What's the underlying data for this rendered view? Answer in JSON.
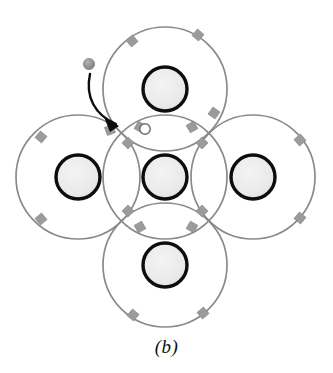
{
  "figure": {
    "caption": "(b)",
    "background_color": "#ffffff"
  },
  "style": {
    "shell_stroke": "#8a8a8a",
    "shell_fill": "none",
    "shell_stroke_width": 1.7,
    "core_ring_color": "#0d0d0d",
    "core_ring_width": 3.4,
    "core_fill": "#ebebeb",
    "core_fill_edge": "#d9d9d9",
    "electron_marker_color": "#9b9b9b",
    "electron_marker_edge": "#8a8a8a",
    "hole_fill": "#ffffff",
    "hole_stroke": "#6e6e6e",
    "free_electron_color": "#8f8f8f",
    "arrow_color": "#0d0d0d",
    "caption_color": "#111111"
  },
  "atoms": [
    {
      "name": "center-atom",
      "label": "center",
      "cx": 165,
      "cy": 177,
      "shell_r": 62,
      "core_r": 22
    },
    {
      "name": "top-atom",
      "label": "top",
      "cx": 165,
      "cy": 89,
      "shell_r": 62,
      "core_r": 22
    },
    {
      "name": "bottom-atom",
      "label": "bottom",
      "cx": 165,
      "cy": 265,
      "shell_r": 62,
      "core_r": 22
    },
    {
      "name": "left-atom",
      "label": "left",
      "cx": 78,
      "cy": 177,
      "shell_r": 62,
      "core_r": 22
    },
    {
      "name": "right-atom",
      "label": "right",
      "cx": 253,
      "cy": 177,
      "shell_r": 62,
      "core_r": 22
    }
  ],
  "electron_markers": [
    {
      "name": "electron-marker-top-left-inner",
      "cx": 128,
      "cy": 143,
      "angle": -45
    },
    {
      "name": "electron-marker-top-right-inner",
      "cx": 202,
      "cy": 143,
      "angle": 45
    },
    {
      "name": "electron-marker-bot-left-inner",
      "cx": 128,
      "cy": 211,
      "angle": 45
    },
    {
      "name": "electron-marker-bot-right-inner",
      "cx": 202,
      "cy": 211,
      "angle": -45
    },
    {
      "name": "electron-marker-top-bond-left",
      "cx": 140,
      "cy": 127,
      "angle": 30
    },
    {
      "name": "electron-marker-top-bond-right",
      "cx": 192,
      "cy": 127,
      "angle": -30
    },
    {
      "name": "electron-marker-bottom-bond-left",
      "cx": 140,
      "cy": 227,
      "angle": -30
    },
    {
      "name": "electron-marker-bottom-bond-right",
      "cx": 192,
      "cy": 227,
      "angle": 30
    },
    {
      "name": "electron-marker-top-outer-left",
      "cx": 132,
      "cy": 41,
      "angle": -40
    },
    {
      "name": "electron-marker-top-outer-right",
      "cx": 198,
      "cy": 35,
      "angle": 40
    },
    {
      "name": "electron-marker-top-shell-right",
      "cx": 214,
      "cy": 113,
      "angle": 35
    },
    {
      "name": "electron-marker-left-outer-top",
      "cx": 41,
      "cy": 137,
      "angle": 40
    },
    {
      "name": "electron-marker-left-outer-bottom",
      "cx": 41,
      "cy": 219,
      "angle": -40
    },
    {
      "name": "electron-marker-left-shell-top",
      "cx": 110,
      "cy": 130,
      "angle": -20
    },
    {
      "name": "electron-marker-right-outer-top",
      "cx": 300,
      "cy": 140,
      "angle": -40
    },
    {
      "name": "electron-marker-right-outer-bot",
      "cx": 300,
      "cy": 218,
      "angle": 40
    },
    {
      "name": "electron-marker-bottom-outer-left",
      "cx": 133,
      "cy": 315,
      "angle": 40
    },
    {
      "name": "electron-marker-bottom-outer-right",
      "cx": 203,
      "cy": 313,
      "angle": -40
    }
  ],
  "hole": {
    "name": "hole-vacancy",
    "label": "hole",
    "cx": 145,
    "cy": 129,
    "r": 5.2
  },
  "free_electron": {
    "name": "free-electron",
    "label": "free electron",
    "cx": 89,
    "cy": 65,
    "r": 5.4
  },
  "arrow": {
    "name": "electron-motion-arrow",
    "label": "electron motion",
    "path": "M 90 73 C 86 96, 96 114, 115 123",
    "head": "M 115 123 L 104 118 L 112 131 Z"
  }
}
